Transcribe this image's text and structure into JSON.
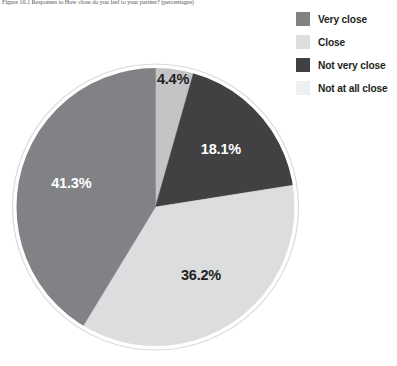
{
  "figure": {
    "caption": "Figure 10.1  Responses to  How close do you feel to your partner? (percentages)"
  },
  "legend": {
    "position": "top-right",
    "items": [
      {
        "label": "Very close",
        "color": "#808285",
        "swatch": "legend-swatch-very-close"
      },
      {
        "label": "Close",
        "color": "#dcdddf",
        "swatch": "legend-swatch-close"
      },
      {
        "label": "Not very close",
        "color": "#414042",
        "swatch": "legend-swatch-not-very-close"
      },
      {
        "label": "Not at all close",
        "color": "#eeeff0",
        "swatch": "legend-swatch-not-at-all-close"
      }
    ]
  },
  "chart_data": {
    "type": "pie",
    "title": "",
    "xlabel": "",
    "ylabel": "",
    "legend_position": "top-right",
    "grid": false,
    "start_angle_deg": 0,
    "direction": "clockwise",
    "categories": [
      "Not at all close",
      "Not very close",
      "Close",
      "Very close"
    ],
    "values": [
      4.4,
      18.1,
      36.2,
      41.3
    ],
    "units": "percent",
    "slices": [
      {
        "label": "Not at all close",
        "value": 4.4,
        "value_text": "4.4%",
        "color": "#c3c4c6",
        "label_color": "#231f20",
        "start_deg": 0.0,
        "end_deg": 15.84
      },
      {
        "label": "Not very close",
        "value": 18.1,
        "value_text": "18.1%",
        "color": "#414042",
        "label_color": "#ffffff",
        "start_deg": 15.84,
        "end_deg": 81.0
      },
      {
        "label": "Close",
        "value": 36.2,
        "value_text": "36.2%",
        "color": "#dcdddf",
        "label_color": "#231f20",
        "start_deg": 81.0,
        "end_deg": 211.32
      },
      {
        "label": "Very close",
        "value": 41.3,
        "value_text": "41.3%",
        "color": "#808285",
        "label_color": "#ffffff",
        "start_deg": 211.32,
        "end_deg": 360.0
      }
    ],
    "labels_text": [
      "4.4%",
      "18.1%",
      "36.2%",
      "41.3%"
    ],
    "outline_color": "#ffffff",
    "background": "#ffffff"
  }
}
